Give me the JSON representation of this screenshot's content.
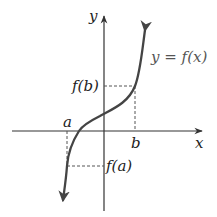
{
  "diagram": {
    "type": "function-graph",
    "axes": {
      "x_label": "x",
      "y_label": "y"
    },
    "curve": {
      "label": "y = f(x)",
      "color": "#444444"
    },
    "points": {
      "a_label": "a",
      "b_label": "b",
      "fa_label": "f(a)",
      "fb_label": "f(b)"
    },
    "colors": {
      "axis": "#333333",
      "dashed": "#555555",
      "text": "#222222",
      "background": "#ffffff"
    }
  }
}
